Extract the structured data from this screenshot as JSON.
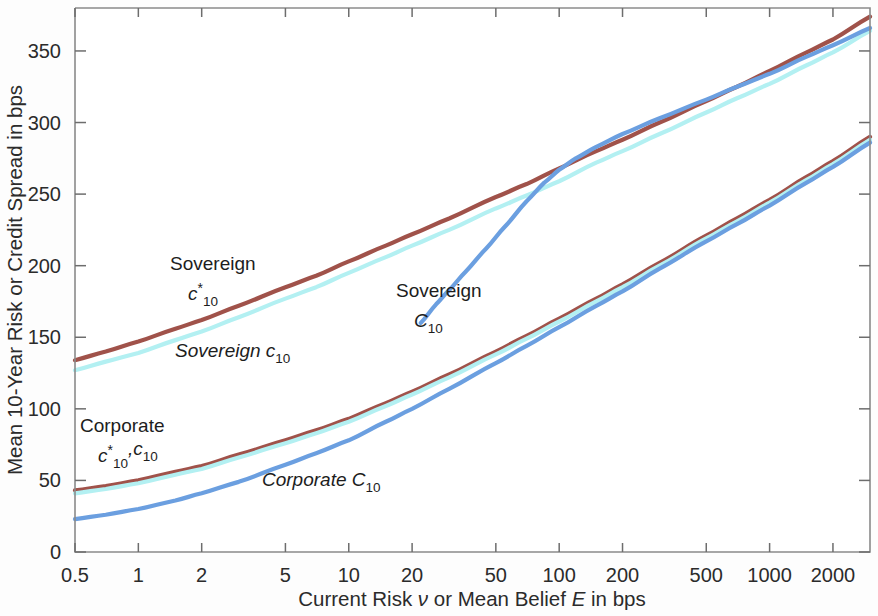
{
  "figure": {
    "background_color": "#fdfdfd",
    "plot_border_color": "#8a8a8a"
  },
  "chart_data": {
    "type": "line",
    "title": "",
    "xlabel": "Current Risk ν or Mean Belief E in bps",
    "ylabel": "Mean 10-Year Risk or Credit Spread in bps",
    "xscale": "log",
    "yscale": "linear",
    "xlim": [
      0.5,
      3000
    ],
    "ylim": [
      0,
      380
    ],
    "grid": false,
    "legend": "annotations-inline",
    "x_tick_labels": [
      "0.5",
      "1",
      "2",
      "5",
      "10",
      "20",
      "50",
      "100",
      "200",
      "500",
      "1000",
      "2000"
    ],
    "x_tick_values": [
      0.5,
      1,
      2,
      5,
      10,
      20,
      50,
      100,
      200,
      500,
      1000,
      2000
    ],
    "y_tick_labels": [
      "0",
      "50",
      "100",
      "150",
      "200",
      "250",
      "300",
      "350"
    ],
    "y_tick_values": [
      0,
      50,
      100,
      150,
      200,
      250,
      300,
      350
    ],
    "series": [
      {
        "name": "Sovereign c*_10",
        "color": "#a0524a",
        "width": 4.2,
        "x": [
          0.5,
          0.7,
          1,
          1.5,
          2,
          3,
          5,
          7,
          10,
          15,
          20,
          30,
          50,
          70,
          100,
          150,
          200,
          300,
          500,
          700,
          1000,
          1500,
          2000,
          3000
        ],
        "y": [
          134,
          140,
          147,
          156,
          162,
          172,
          185,
          193,
          203,
          214,
          222,
          233,
          248,
          257,
          268,
          280,
          288,
          300,
          315,
          325,
          336,
          349,
          358,
          374
        ]
      },
      {
        "name": "Sovereign c_10",
        "color": "#b3f0f2",
        "width": 4.2,
        "x": [
          0.5,
          0.7,
          1,
          1.5,
          2,
          3,
          5,
          7,
          10,
          15,
          20,
          30,
          50,
          70,
          100,
          150,
          200,
          300,
          500,
          700,
          1000,
          1500,
          2000,
          3000
        ],
        "y": [
          127,
          133,
          139,
          148,
          154,
          164,
          177,
          185,
          195,
          206,
          214,
          225,
          240,
          249,
          259,
          272,
          280,
          292,
          307,
          317,
          327,
          340,
          349,
          364
        ]
      },
      {
        "name": "Sovereign C_10",
        "color": "#6b9fe0",
        "width": 4.2,
        "x": [
          22,
          26,
          30,
          36,
          45,
          55,
          70,
          85,
          100,
          120,
          150,
          200,
          300,
          500,
          700,
          1000,
          1500,
          2000,
          3000
        ],
        "y": [
          160,
          173,
          183,
          196,
          212,
          227,
          245,
          258,
          267,
          275,
          283,
          292,
          303,
          316,
          325,
          334,
          346,
          354,
          366
        ]
      },
      {
        "name": "Corporate c*_10",
        "color": "#a0524a",
        "width": 4.2,
        "x": [
          0.5,
          0.7,
          1,
          1.5,
          2,
          3,
          5,
          7,
          10,
          15,
          20,
          30,
          50,
          70,
          100,
          150,
          200,
          300,
          500,
          700,
          1000,
          1500,
          2000,
          3000
        ],
        "y": [
          43,
          46,
          50,
          56,
          60,
          68,
          78,
          85,
          93,
          104,
          112,
          124,
          140,
          151,
          163,
          177,
          187,
          202,
          221,
          233,
          246,
          262,
          273,
          290
        ]
      },
      {
        "name": "Corporate c_10",
        "color": "#b3f0f2",
        "width": 4.2,
        "x": [
          0.5,
          0.7,
          1,
          1.5,
          2,
          3,
          5,
          7,
          10,
          15,
          20,
          30,
          50,
          70,
          100,
          150,
          200,
          300,
          500,
          700,
          1000,
          1500,
          2000,
          3000
        ],
        "y": [
          41,
          44,
          48,
          54,
          58,
          66,
          76,
          83,
          91,
          102,
          110,
          122,
          138,
          149,
          161,
          175,
          185,
          200,
          219,
          231,
          244,
          260,
          271,
          288
        ]
      },
      {
        "name": "Corporate C_10",
        "color": "#6b9fe0",
        "width": 4.2,
        "x": [
          0.5,
          0.7,
          1,
          1.5,
          2,
          3,
          5,
          7,
          10,
          15,
          20,
          30,
          50,
          70,
          100,
          150,
          200,
          300,
          500,
          700,
          1000,
          1500,
          2000,
          3000
        ],
        "y": [
          23,
          26,
          30,
          36,
          41,
          49,
          61,
          69,
          78,
          91,
          100,
          114,
          132,
          144,
          157,
          172,
          182,
          198,
          217,
          229,
          242,
          258,
          269,
          286
        ]
      }
    ],
    "annotations": [
      {
        "id": "sovereign-c-star-10",
        "line1": "Sovereign",
        "base": "c",
        "star": "*",
        "subscript": "10",
        "suffix": "",
        "x_px": 170,
        "y_px": 270
      },
      {
        "id": "sovereign-c-10",
        "line1": "",
        "base": "Sovereign c",
        "star": "",
        "subscript": "10",
        "suffix": "",
        "x_px": 175,
        "y_px": 357
      },
      {
        "id": "sovereign-capital-c-10",
        "line1": "Sovereign",
        "base": "C",
        "star": "",
        "subscript": "10",
        "suffix": "",
        "x_px": 396,
        "y_px": 297
      },
      {
        "id": "corporate-c-star-10-c-10",
        "line1": "Corporate",
        "base": "c",
        "star": "*",
        "subscript": "10",
        "suffix": ",c",
        "suffix_sub": "10",
        "x_px": 80,
        "y_px": 432
      },
      {
        "id": "corporate-capital-c-10",
        "line1": "",
        "base": "Corporate C",
        "star": "",
        "subscript": "10",
        "suffix": "",
        "x_px": 262,
        "y_px": 486
      }
    ]
  }
}
